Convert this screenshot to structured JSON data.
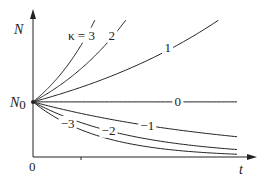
{
  "chart_data": {
    "type": "line",
    "title": "",
    "xlabel": "t",
    "ylabel": "N",
    "y0_label": "N",
    "y0_subscript": "0",
    "origin_label": "0",
    "xlim": [
      0,
      1
    ],
    "ylim": [
      0,
      1.6
    ],
    "grid": false,
    "legend": "none (inline curve labels)",
    "model": "N(t) = N0 * exp(kappa * t)",
    "N0": 0.6,
    "series": [
      {
        "name": "κ = 3",
        "kappa": 3,
        "label": "κ = 3"
      },
      {
        "name": "2",
        "kappa": 2,
        "label": "2"
      },
      {
        "name": "1",
        "kappa": 1,
        "label": "1"
      },
      {
        "name": "0",
        "kappa": 0,
        "label": "0"
      },
      {
        "name": "−1",
        "kappa": -1,
        "label": "−1"
      },
      {
        "name": "−2",
        "kappa": -2,
        "label": "−2"
      },
      {
        "name": "−3",
        "kappa": -3,
        "label": "−3"
      }
    ]
  }
}
